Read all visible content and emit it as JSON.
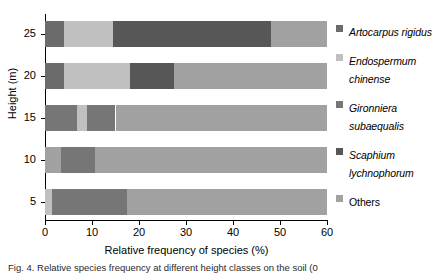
{
  "chart_data": {
    "type": "bar",
    "orientation": "horizontal",
    "stacked": true,
    "title": "",
    "xlabel": "Relative frequency of species (%)",
    "ylabel": "Height (m)",
    "xlim": [
      0,
      60
    ],
    "xticks": [
      0,
      10,
      20,
      30,
      40,
      50,
      60
    ],
    "yticks": [
      5,
      10,
      15,
      20,
      25
    ],
    "categories": [
      "5",
      "10",
      "15",
      "20",
      "25"
    ],
    "grid": false,
    "legend_position": "right",
    "series": [
      {
        "name": "Artocarpus rigidus",
        "color": "#6b6b6b",
        "values": [
          0.0,
          0.0,
          0.0,
          4.0,
          4.0
        ]
      },
      {
        "name": "Endospermum chinense",
        "color": "#c0c0c0",
        "values": [
          1.5,
          3.5,
          2.2,
          14.0,
          10.5
        ]
      },
      {
        "name": "Gironniera subaequalis",
        "color": "#767676",
        "values": [
          16.0,
          7.2,
          12.8,
          0.0,
          0.0
        ]
      },
      {
        "name": "Scaphium lychnophorum",
        "color": "#575757",
        "values": [
          0.0,
          0.0,
          0.0,
          9.5,
          33.5
        ]
      },
      {
        "name": "Others",
        "color": "#a1a1a1",
        "values": [
          42.5,
          49.3,
          45.0,
          32.5,
          12.0
        ]
      }
    ],
    "bars": [
      {
        "category": "25",
        "segments": [
          {
            "series": "Artocarpus rigidus",
            "start": 0.0,
            "end": 4.0,
            "value": 4.0,
            "color": "#6b6b6b"
          },
          {
            "series": "Endospermum chinense",
            "start": 4.0,
            "end": 14.5,
            "value": 10.5,
            "color": "#c0c0c0"
          },
          {
            "series": "Scaphium lychnophorum",
            "start": 14.5,
            "end": 48.0,
            "value": 33.5,
            "color": "#575757"
          },
          {
            "series": "Others",
            "start": 48.0,
            "end": 60.0,
            "value": 12.0,
            "color": "#a1a1a1"
          }
        ]
      },
      {
        "category": "20",
        "segments": [
          {
            "series": "Artocarpus rigidus",
            "start": 0.0,
            "end": 4.0,
            "value": 4.0,
            "color": "#6b6b6b"
          },
          {
            "series": "Endospermum chinense",
            "start": 4.0,
            "end": 18.0,
            "value": 14.0,
            "color": "#c0c0c0"
          },
          {
            "series": "Scaphium lychnophorum",
            "start": 18.0,
            "end": 27.5,
            "value": 9.5,
            "color": "#575757"
          },
          {
            "series": "Others",
            "start": 27.5,
            "end": 60.0,
            "value": 32.5,
            "color": "#a1a1a1"
          }
        ]
      },
      {
        "category": "15",
        "segments": [
          {
            "series": "Gironniera subaequalis",
            "start": 0.0,
            "end": 6.8,
            "value": 6.8,
            "color": "#767676"
          },
          {
            "series": "Endospermum chinense",
            "start": 6.8,
            "end": 9.0,
            "value": 2.2,
            "color": "#c0c0c0"
          },
          {
            "series": "Gironniera subaequalis",
            "start": 9.0,
            "end": 15.0,
            "value": 6.0,
            "color": "#767676"
          },
          {
            "series": "Others",
            "start": 15.0,
            "end": 60.0,
            "value": 45.0,
            "color": "#a1a1a1"
          }
        ]
      },
      {
        "category": "10",
        "segments": [
          {
            "series": "Endospermum chinense",
            "start": 0.0,
            "end": 3.5,
            "value": 3.5,
            "color": "#a1a1a1"
          },
          {
            "series": "Gironniera subaequalis",
            "start": 3.5,
            "end": 10.7,
            "value": 7.2,
            "color": "#767676"
          },
          {
            "series": "Others",
            "start": 10.7,
            "end": 60.0,
            "value": 49.3,
            "color": "#a1a1a1"
          }
        ]
      },
      {
        "category": "5",
        "segments": [
          {
            "series": "Endospermum chinense",
            "start": 0.0,
            "end": 1.5,
            "value": 1.5,
            "color": "#c0c0c0"
          },
          {
            "series": "Gironniera subaequalis",
            "start": 1.5,
            "end": 17.5,
            "value": 16.0,
            "color": "#767676"
          },
          {
            "series": "Others",
            "start": 17.5,
            "end": 60.0,
            "value": 42.5,
            "color": "#a1a1a1"
          }
        ]
      }
    ]
  },
  "axes": {
    "ylabel": "Height (m)",
    "xlabel": "Relative frequency of species (%)",
    "xticklabels": [
      "0",
      "10",
      "20",
      "30",
      "40",
      "50",
      "60"
    ],
    "yticklabels": [
      "25",
      "20",
      "15",
      "10",
      "5"
    ]
  },
  "legend": {
    "items": [
      {
        "label": "Artocarpus rigidus",
        "color": "#6b6b6b",
        "italic": true
      },
      {
        "label": "Endospermum chinense",
        "color": "#c0c0c0",
        "italic": true
      },
      {
        "label": "Gironniera subaequalis",
        "color": "#767676",
        "italic": true
      },
      {
        "label": "Scaphium lychnophorum",
        "color": "#575757",
        "italic": true
      },
      {
        "label": "Others",
        "color": "#a1a1a1",
        "italic": false
      }
    ]
  },
  "caption": {
    "text": "Fig. 4. Relative species frequency at different height classes on the soil (0"
  }
}
